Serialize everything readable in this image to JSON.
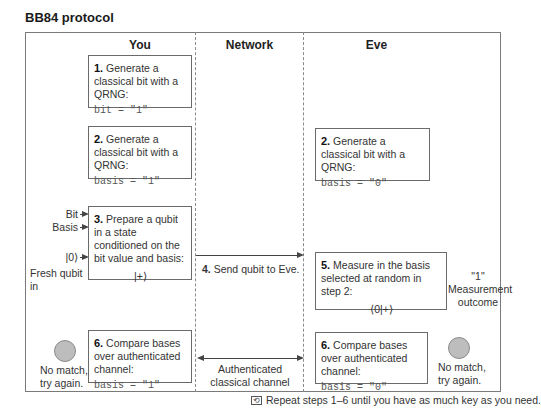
{
  "title": "BB84 protocol",
  "columns": [
    "You",
    "Network",
    "Eve"
  ],
  "you": {
    "step1": {
      "num": "1.",
      "text": "Generate a classical bit with a QRNG:",
      "code": "bit = \"1\""
    },
    "step2": {
      "num": "2.",
      "text": "Generate a classical bit with a QRNG:",
      "code": "basis = \"1\""
    },
    "step3": {
      "num": "3.",
      "text": "Prepare a qubit in a state conditioned on the bit value and basis:",
      "state": "|+⟩"
    },
    "step3_inputs": {
      "bit": "Bit",
      "basis": "Basis",
      "ket0": "|0⟩",
      "fresh": "Fresh qubit in"
    },
    "step6": {
      "num": "6.",
      "text": "Compare bases over authenticated channel:",
      "code": "basis = \"1\""
    },
    "nomatch": [
      "No match,",
      "try again."
    ]
  },
  "network": {
    "step4": {
      "num": "4.",
      "text": "Send qubit to Eve."
    },
    "channel": [
      "Authenticated",
      "classical channel"
    ]
  },
  "eve": {
    "step2": {
      "num": "2.",
      "text": "Generate a classical bit with a QRNG:",
      "code": "basis = \"0\""
    },
    "step5": {
      "num": "5.",
      "text": "Measure in the basis selected at random in step 2:",
      "state": "⟨0|+⟩"
    },
    "outcome": [
      "\"1\"",
      "Measurement",
      "outcome"
    ],
    "step6": {
      "num": "6.",
      "text": "Compare bases over authenticated channel:",
      "code": "basis = \"0\""
    },
    "nomatch": [
      "No match,",
      "try again."
    ]
  },
  "footer": {
    "icon": "repeat-icon",
    "text": "Repeat steps 1–6 until you have as much key as you need."
  }
}
